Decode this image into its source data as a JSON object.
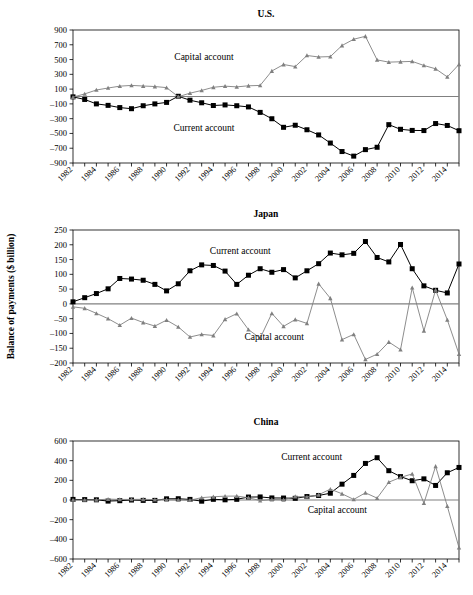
{
  "figure": {
    "ylabel": "Balance of payments ($ billion)",
    "series_names": {
      "current": "Current account",
      "capital": "Capital account"
    },
    "colors": {
      "current": "#000000",
      "capital": "#808080",
      "axis": "#000000",
      "zero": "#808080",
      "background": "#ffffff"
    }
  },
  "chart_data": [
    {
      "type": "line",
      "title": "U.S.",
      "xlabel": "",
      "ylabel": "Balance of payments ($ billion)",
      "grid": false,
      "legend": "inline-annotation",
      "xlim": [
        1982,
        2015
      ],
      "ylim": [
        -900,
        900
      ],
      "yticks": [
        900,
        700,
        500,
        300,
        100,
        -100,
        -300,
        -500,
        -700,
        -900
      ],
      "xticks": [
        1982,
        1984,
        1986,
        1988,
        1990,
        1992,
        1994,
        1996,
        1998,
        2000,
        2002,
        2004,
        2006,
        2008,
        2010,
        2012,
        2014
      ],
      "x": [
        1982,
        1983,
        1984,
        1985,
        1986,
        1987,
        1988,
        1989,
        1990,
        1991,
        1992,
        1993,
        1994,
        1995,
        1996,
        1997,
        1998,
        1999,
        2000,
        2001,
        2002,
        2003,
        2004,
        2005,
        2006,
        2007,
        2008,
        2009,
        2010,
        2011,
        2012,
        2013,
        2014,
        2015
      ],
      "series": [
        {
          "name": "Current account",
          "marker": "square",
          "color": "#000000",
          "values": [
            -5,
            -40,
            -100,
            -120,
            -150,
            -165,
            -125,
            -100,
            -80,
            3,
            -50,
            -85,
            -122,
            -114,
            -125,
            -141,
            -215,
            -301,
            -417,
            -389,
            -450,
            -520,
            -630,
            -745,
            -807,
            -719,
            -687,
            -381,
            -444,
            -459,
            -461,
            -366,
            -392,
            -463
          ]
        },
        {
          "name": "Capital account",
          "marker": "triangle",
          "color": "#808080",
          "values": [
            -8,
            35,
            88,
            115,
            140,
            150,
            142,
            135,
            120,
            -3,
            45,
            82,
            125,
            140,
            130,
            145,
            150,
            345,
            433,
            405,
            555,
            535,
            540,
            690,
            775,
            815,
            495,
            465,
            470,
            475,
            420,
            375,
            265,
            435
          ]
        }
      ],
      "annotations": [
        {
          "text": "Capital account",
          "x": 1993.2,
          "y": 500
        },
        {
          "text": "Current account",
          "x": 1993.2,
          "y": -470
        }
      ]
    },
    {
      "type": "line",
      "title": "Japan",
      "xlabel": "",
      "ylabel": "Balance of payments ($ billion)",
      "grid": false,
      "legend": "inline-annotation",
      "xlim": [
        1982,
        2015
      ],
      "ylim": [
        -200,
        250
      ],
      "yticks": [
        250,
        200,
        150,
        100,
        50,
        0,
        -50,
        -100,
        -150,
        -200
      ],
      "xticks": [
        1982,
        1984,
        1986,
        1988,
        1990,
        1992,
        1994,
        1996,
        1998,
        2000,
        2002,
        2004,
        2006,
        2008,
        2010,
        2012,
        2014
      ],
      "x": [
        1982,
        1983,
        1984,
        1985,
        1986,
        1987,
        1988,
        1989,
        1990,
        1991,
        1992,
        1993,
        1994,
        1995,
        1996,
        1997,
        1998,
        1999,
        2000,
        2001,
        2002,
        2003,
        2004,
        2005,
        2006,
        2007,
        2008,
        2009,
        2010,
        2011,
        2012,
        2013,
        2014,
        2015
      ],
      "series": [
        {
          "name": "Current account",
          "marker": "square",
          "color": "#000000",
          "values": [
            7,
            21,
            35,
            51,
            86,
            84,
            80,
            66,
            44,
            68,
            112,
            132,
            130,
            111,
            66,
            97,
            119,
            107,
            116,
            88,
            112,
            136,
            172,
            166,
            171,
            211,
            157,
            142,
            201,
            119,
            61,
            46,
            37,
            135
          ]
        },
        {
          "name": "Capital account",
          "marker": "triangle",
          "color": "#808080",
          "values": [
            -10,
            -15,
            -32,
            -50,
            -72,
            -48,
            -63,
            -75,
            -55,
            -78,
            -112,
            -103,
            -107,
            -52,
            -33,
            -87,
            -116,
            -32,
            -76,
            -53,
            -66,
            68,
            19,
            -121,
            -103,
            -188,
            -170,
            -129,
            -155,
            55,
            -91,
            47,
            -54,
            -170
          ]
        }
      ],
      "annotations": [
        {
          "text": "Current account",
          "x": 1996.3,
          "y": 170
        },
        {
          "text": "Capital account",
          "x": 1999.2,
          "y": -122
        }
      ]
    },
    {
      "type": "line",
      "title": "China",
      "xlabel": "",
      "ylabel": "Balance of payments ($ billion)",
      "grid": false,
      "legend": "inline-annotation",
      "xlim": [
        1982,
        2015
      ],
      "ylim": [
        -600,
        600
      ],
      "yticks": [
        600,
        400,
        200,
        0,
        -200,
        -400,
        -600
      ],
      "xticks": [
        1982,
        1984,
        1986,
        1988,
        1990,
        1992,
        1994,
        1996,
        1998,
        2000,
        2002,
        2004,
        2006,
        2008,
        2010,
        2012,
        2014
      ],
      "x": [
        1982,
        1983,
        1984,
        1985,
        1986,
        1987,
        1988,
        1989,
        1990,
        1991,
        1992,
        1993,
        1994,
        1995,
        1996,
        1997,
        1998,
        1999,
        2000,
        2001,
        2002,
        2003,
        2004,
        2005,
        2006,
        2007,
        2008,
        2009,
        2010,
        2011,
        2012,
        2013,
        2014,
        2015
      ],
      "series": [
        {
          "name": "Current account",
          "marker": "square",
          "color": "#000000",
          "values": [
            6,
            4,
            2,
            -11,
            -7,
            0,
            -4,
            -4,
            12,
            13,
            6,
            -12,
            7,
            2,
            7,
            30,
            31,
            21,
            20,
            17,
            35,
            46,
            69,
            161,
            250,
            372,
            430,
            298,
            238,
            196,
            215,
            148,
            277,
            331
          ]
        },
        {
          "name": "Capital account",
          "marker": "triangle",
          "color": "#808080",
          "values": [
            0,
            0,
            1,
            9,
            6,
            6,
            7,
            4,
            3,
            1,
            -2,
            24,
            33,
            39,
            40,
            23,
            -6,
            5,
            2,
            35,
            32,
            53,
            111,
            63,
            6,
            73,
            19,
            181,
            230,
            265,
            -32,
            343,
            -63,
            -485
          ]
        }
      ],
      "annotations": [
        {
          "text": "Current account",
          "x": 2002.4,
          "y": 410
        },
        {
          "text": "Capital account",
          "x": 2004.6,
          "y": -130
        }
      ]
    }
  ]
}
